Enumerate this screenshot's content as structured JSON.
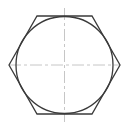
{
  "drawing": {
    "title": "Hexagon with inscribed circle",
    "colors": {
      "outline": "#3a3a3a",
      "centerline": "#b8b8b8",
      "background": "#ffffff"
    },
    "hexagon": {
      "points": "9,65 37,16 92,16 120,65 92,114 37,114",
      "stroke_width": 1.3
    },
    "circle": {
      "cx": 64.5,
      "cy": 65,
      "r": 48.5,
      "stroke_width": 1.3
    },
    "centerlines": {
      "horizontal": {
        "x1": 9,
        "y1": 65,
        "x2": 120,
        "y2": 65
      },
      "vertical": {
        "x1": 64.5,
        "y1": 8,
        "x2": 64.5,
        "y2": 122
      },
      "dash_pattern": "12,3,3,3",
      "stroke_width": 0.8
    }
  }
}
